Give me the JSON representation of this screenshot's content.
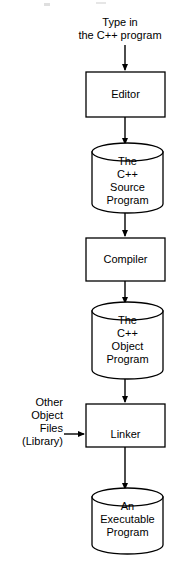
{
  "diagram": {
    "background_color": "#ffffff",
    "stroke_color": "#000000",
    "fill_color": "#ffffff",
    "captions": {
      "top": "Type in\nthe C++ program",
      "side": "Other\nObject\nFiles\n(Library)"
    },
    "nodes": [
      {
        "id": "editor",
        "shape": "rectangle",
        "label": "Editor"
      },
      {
        "id": "source",
        "shape": "cylinder",
        "label": "The\nC++\nSource\nProgram"
      },
      {
        "id": "compiler",
        "shape": "rectangle",
        "label": "Compiler"
      },
      {
        "id": "object",
        "shape": "cylinder",
        "label": "The\nC++\nObject\nProgram"
      },
      {
        "id": "linker",
        "shape": "rectangle",
        "label": "Linker"
      },
      {
        "id": "exec",
        "shape": "cylinder",
        "label": "An\nExecutable\nProgram"
      }
    ],
    "edges": [
      {
        "from": "top-caption",
        "to": "editor",
        "direction": "down"
      },
      {
        "from": "editor",
        "to": "source",
        "direction": "down"
      },
      {
        "from": "source",
        "to": "compiler",
        "direction": "down"
      },
      {
        "from": "compiler",
        "to": "object",
        "direction": "down"
      },
      {
        "from": "object",
        "to": "linker",
        "direction": "down"
      },
      {
        "from": "side-caption",
        "to": "linker",
        "direction": "right"
      },
      {
        "from": "linker",
        "to": "exec",
        "direction": "down"
      }
    ]
  }
}
